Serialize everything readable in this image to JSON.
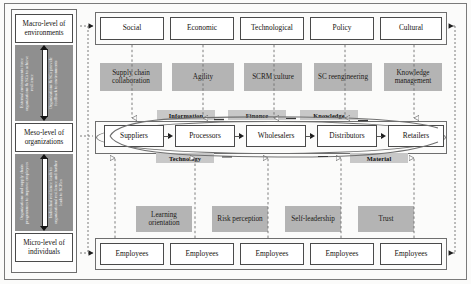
{
  "levels": [
    {
      "id": "macro",
      "label": "Macro-level of environments"
    },
    {
      "id": "meso",
      "label": "Meso-level of organizations"
    },
    {
      "id": "micro",
      "label": "Micro-level of individuals"
    }
  ],
  "vertical_links": [
    {
      "id": "macro-meso",
      "left_text": "External environments force organizations & SCs to achieve resilience",
      "right_text": "Organizations & SCs provide feedback to environments"
    },
    {
      "id": "meso-micro",
      "left_text": "Organizations and supply chain programmes to improve employees",
      "right_text": "Individual resilience leads to organizational resilience and further leads to SCRes"
    }
  ],
  "macro_row": {
    "name": "environment-factors",
    "items": [
      {
        "label": "Social"
      },
      {
        "label": "Economic"
      },
      {
        "label": "Technological"
      },
      {
        "label": "Policy"
      },
      {
        "label": "Cultural"
      }
    ]
  },
  "meso_capabilities": {
    "name": "organizational-capabilities",
    "items": [
      {
        "label": "Supply chain collaboration"
      },
      {
        "label": "Agility"
      },
      {
        "label": "SCRM culture"
      },
      {
        "label": "SC reengineering"
      },
      {
        "label": "Knowledge management"
      }
    ]
  },
  "supply_chain": {
    "name": "supply-chain-nodes",
    "nodes": [
      {
        "label": "Suppliers"
      },
      {
        "label": "Processors"
      },
      {
        "label": "Wholesalers"
      },
      {
        "label": "Distributors"
      },
      {
        "label": "Retailers"
      }
    ],
    "flows_top": [
      {
        "label": "Information"
      },
      {
        "label": "Finance"
      },
      {
        "label": "Knowledge"
      }
    ],
    "flows_bottom": [
      {
        "label": "Technology"
      },
      {
        "label": "Material"
      }
    ]
  },
  "micro_capabilities": {
    "name": "individual-capabilities",
    "items": [
      {
        "label": "Learning orientation"
      },
      {
        "label": "Risk perception"
      },
      {
        "label": "Self-leadership"
      },
      {
        "label": "Trust"
      }
    ]
  },
  "micro_row": {
    "name": "employee-row",
    "items": [
      {
        "label": "Employees"
      },
      {
        "label": "Employees"
      },
      {
        "label": "Employees"
      },
      {
        "label": "Employees"
      },
      {
        "label": "Employees"
      }
    ]
  },
  "colors": {
    "gray_box": "#b4b4b4",
    "flow_label": "#c8c8c8",
    "panel_gray": "#8f8f8f",
    "border": "#4a4a4a",
    "background": "#fbfbfa"
  }
}
